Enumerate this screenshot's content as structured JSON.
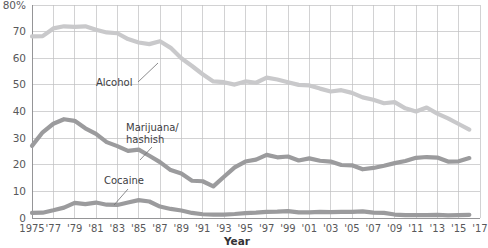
{
  "chart_data": {
    "type": "line",
    "title": "",
    "xlabel": "Year",
    "ylabel": "",
    "xlim": [
      1975,
      2017
    ],
    "ylim": [
      0,
      80
    ],
    "grid": true,
    "legend_position": "inline-annotations",
    "ytick_labels": [
      "0",
      "10",
      "20",
      "30",
      "40",
      "50",
      "60",
      "70",
      "80%"
    ],
    "ytick_values": [
      0,
      10,
      20,
      30,
      40,
      50,
      60,
      70,
      80
    ],
    "xtick_labels": [
      "1975",
      "'77",
      "'79",
      "'81",
      "'83",
      "'85",
      "'87",
      "'89",
      "'91",
      "'93",
      "'95",
      "'97",
      "'99",
      "'01",
      "'03",
      "'05",
      "'07",
      "'09",
      "'11",
      "'13",
      "'15",
      "'17"
    ],
    "xtick_values": [
      1975,
      1977,
      1979,
      1981,
      1983,
      1985,
      1987,
      1989,
      1991,
      1993,
      1995,
      1997,
      1999,
      2001,
      2003,
      2005,
      2007,
      2009,
      2011,
      2013,
      2015,
      2017
    ],
    "x": [
      1975,
      1976,
      1977,
      1978,
      1979,
      1980,
      1981,
      1982,
      1983,
      1984,
      1985,
      1986,
      1987,
      1988,
      1989,
      1990,
      1991,
      1992,
      1993,
      1994,
      1995,
      1996,
      1997,
      1998,
      1999,
      2000,
      2001,
      2002,
      2003,
      2004,
      2005,
      2006,
      2007,
      2008,
      2009,
      2010,
      2011,
      2012,
      2013,
      2014,
      2015,
      2016
    ],
    "series": [
      {
        "name": "Alcohol",
        "color": "#c9c9cb",
        "values": [
          68.2,
          68.3,
          71.2,
          72.0,
          71.8,
          72.0,
          70.7,
          69.7,
          69.4,
          67.2,
          65.9,
          65.3,
          66.4,
          63.9,
          60.0,
          57.1,
          54.0,
          51.3,
          51.0,
          50.1,
          51.3,
          50.8,
          52.7,
          52.0,
          51.0,
          50.0,
          49.8,
          48.6,
          47.5,
          48.0,
          47.0,
          45.3,
          44.4,
          43.1,
          43.5,
          41.2,
          40.0,
          41.5,
          39.2,
          37.4,
          35.3,
          33.2
        ]
      },
      {
        "name": "Marijuana/hashish",
        "color": "#9b9b9d",
        "values": [
          27.1,
          32.2,
          35.4,
          37.1,
          36.5,
          33.7,
          31.6,
          28.5,
          27.0,
          25.2,
          25.7,
          23.4,
          21.0,
          18.0,
          16.7,
          14.0,
          13.8,
          11.9,
          15.5,
          19.0,
          21.2,
          21.9,
          23.7,
          22.8,
          23.1,
          21.6,
          22.4,
          21.5,
          21.2,
          19.9,
          19.8,
          18.3,
          18.8,
          19.6,
          20.6,
          21.4,
          22.6,
          22.9,
          22.7,
          21.2,
          21.3,
          22.5
        ]
      },
      {
        "name": "Cocaine",
        "color": "#9b9b9d",
        "values": [
          1.9,
          2.0,
          2.9,
          3.9,
          5.7,
          5.2,
          5.8,
          5.0,
          4.9,
          5.8,
          6.7,
          6.2,
          4.3,
          3.4,
          2.8,
          1.9,
          1.4,
          1.3,
          1.3,
          1.5,
          1.8,
          2.0,
          2.3,
          2.4,
          2.6,
          2.1,
          2.1,
          2.3,
          2.2,
          2.3,
          2.3,
          2.5,
          2.0,
          1.9,
          1.3,
          1.1,
          1.1,
          1.1,
          1.2,
          1.0,
          1.1,
          1.2
        ]
      }
    ],
    "annotations": [
      {
        "label": "Alcohol",
        "line1": "Alcohol",
        "line2": ""
      },
      {
        "label": "Marijuana/hashish",
        "line1": "Marijuana/",
        "line2": "hashish"
      },
      {
        "label": "Cocaine",
        "line1": "Cocaine",
        "line2": ""
      }
    ]
  },
  "axis": {
    "x_title": "Year"
  }
}
